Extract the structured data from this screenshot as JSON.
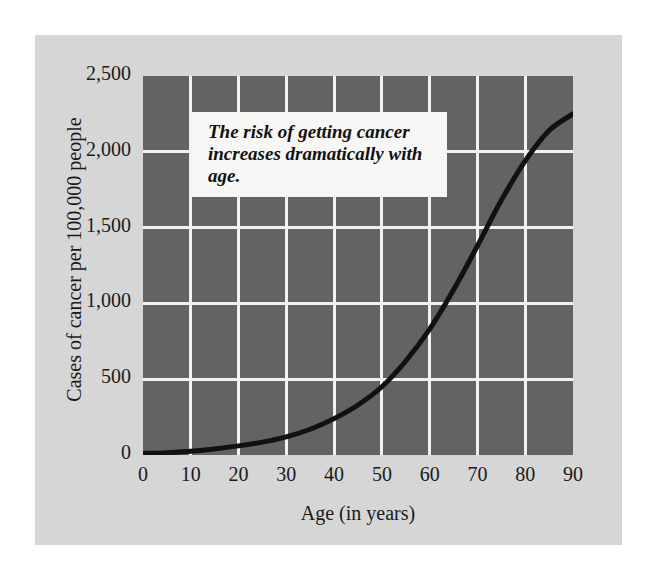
{
  "figure": {
    "background_color": "#d6d6d6",
    "plot_background_color": "#636363",
    "gridline_color": "#f2f2f2",
    "curve_color": "#111111",
    "annotation": {
      "text": "The risk of getting cancer increases dramatically with age.",
      "background_color": "#f7f7f5"
    }
  },
  "chart_data": {
    "type": "line",
    "title": "",
    "subtitle": "",
    "xlabel": "Age (in years)",
    "ylabel": "Cases of cancer per 100,000 people",
    "xlim": [
      0,
      90
    ],
    "ylim": [
      0,
      2500
    ],
    "xticks": [
      "0",
      "10",
      "20",
      "30",
      "40",
      "50",
      "60",
      "70",
      "80",
      "90"
    ],
    "xtick_values": [
      0,
      10,
      20,
      30,
      40,
      50,
      60,
      70,
      80,
      90
    ],
    "yticks": [
      "0",
      "500",
      "1,000",
      "1,500",
      "2,000",
      "2,500"
    ],
    "ytick_values": [
      0,
      500,
      1000,
      1500,
      2000,
      2500
    ],
    "grid": true,
    "legend": false,
    "legend_position": "none",
    "annotations": [
      {
        "text": "The risk of getting cancer increases dramatically with age.",
        "x": 10,
        "y": 2200
      }
    ],
    "series": [
      {
        "name": "Cases of cancer per 100,000 people",
        "color": "#111111",
        "x": [
          0,
          5,
          10,
          15,
          20,
          25,
          30,
          35,
          40,
          45,
          50,
          55,
          60,
          65,
          70,
          75,
          80,
          85,
          90
        ],
        "values": [
          10,
          15,
          25,
          40,
          60,
          85,
          120,
          170,
          240,
          330,
          450,
          620,
          830,
          1090,
          1380,
          1680,
          1940,
          2140,
          2250
        ]
      }
    ]
  }
}
